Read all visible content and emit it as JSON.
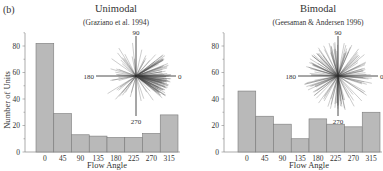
{
  "panel_label": "(b)",
  "colors": {
    "bar_fill": "#b9b9b9",
    "bar_stroke": "#7a7a7a",
    "axis": "#888888",
    "text": "#333333",
    "rose": "#444444"
  },
  "chart_data": [
    {
      "type": "bar",
      "title": "Unimodal",
      "subtitle": "(Graziano et al. 1994)",
      "xlabel": "Flow Angle",
      "ylabel": "Number of Units",
      "categories": [
        "0",
        "45",
        "90",
        "135",
        "180",
        "225",
        "270",
        "315"
      ],
      "values": [
        82,
        29,
        13,
        12,
        11,
        11,
        14,
        28
      ],
      "yticks": [
        "0",
        "20",
        "40",
        "60",
        "80"
      ],
      "ylim": [
        0,
        90
      ],
      "grid": false,
      "inset": {
        "type": "polar-rose",
        "labels": {
          "top": "90",
          "left": "180",
          "bottom": "270",
          "right": "0"
        },
        "description": "Preferred directions concentrated near 0°"
      }
    },
    {
      "type": "bar",
      "title": "Bimodal",
      "subtitle": "(Geesaman & Andersen 1996)",
      "xlabel": "Flow Angle",
      "ylabel": "",
      "categories": [
        "0",
        "45",
        "90",
        "135",
        "180",
        "225",
        "270",
        "315"
      ],
      "values": [
        46,
        27,
        21,
        10,
        25,
        21,
        19,
        30
      ],
      "yticks": [
        "0",
        "20",
        "40",
        "60",
        "80"
      ],
      "ylim": [
        0,
        90
      ],
      "grid": false,
      "inset": {
        "type": "polar-rose",
        "labels": {
          "top": "90",
          "left": "180",
          "bottom": "270",
          "right": "0"
        },
        "description": "Preferred directions spread in all directions"
      }
    }
  ]
}
